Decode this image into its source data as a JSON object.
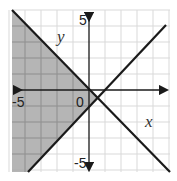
{
  "graph": {
    "axes": {
      "x_label": "x",
      "y_label": "y",
      "x_min": -5,
      "x_max": 5,
      "y_min": -5,
      "y_max": 5,
      "tick_labels": {
        "x_neg": "-5",
        "origin": "0",
        "y_pos": "5",
        "y_neg": "-5"
      }
    },
    "lines": [
      {
        "name": "boundary-line-1",
        "equation": "y = -x"
      },
      {
        "name": "boundary-line-2",
        "equation": "y = x - 1"
      }
    ],
    "shaded_region": "left wedge: y <= -x and y >= x - 1",
    "colors": {
      "shade": "#a8a8a8",
      "grid": "#d9d9d9",
      "line": "#1a1a1a"
    }
  }
}
